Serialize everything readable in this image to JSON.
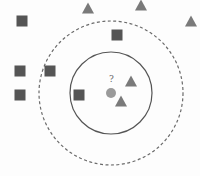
{
  "diagram": {
    "type": "knn-classification",
    "colors": {
      "square": "#555555",
      "triangle": "#7a7a7a",
      "query": "#9a9a9a",
      "inner_circle": "#555555",
      "outer_circle": "#6a6a6a"
    },
    "query": {
      "x": 111,
      "y": 93,
      "r": 5,
      "label": "?"
    },
    "inner_circle": {
      "cx": 111,
      "cy": 93,
      "r": 41,
      "style": "solid"
    },
    "outer_circle": {
      "cx": 111,
      "cy": 93,
      "r": 72,
      "style": "dashed"
    },
    "squares": [
      {
        "x": 22,
        "y": 21
      },
      {
        "x": 20,
        "y": 71
      },
      {
        "x": 50,
        "y": 71
      },
      {
        "x": 20,
        "y": 95
      },
      {
        "x": 79,
        "y": 95
      },
      {
        "x": 117,
        "y": 35
      }
    ],
    "triangles": [
      {
        "x": 88,
        "y": 8
      },
      {
        "x": 141,
        "y": 5
      },
      {
        "x": 191,
        "y": 21
      },
      {
        "x": 131,
        "y": 81
      },
      {
        "x": 121,
        "y": 101
      }
    ]
  }
}
